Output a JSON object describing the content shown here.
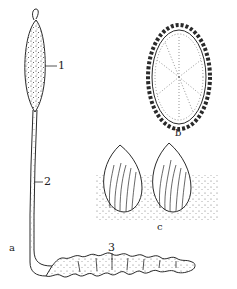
{
  "figure": {
    "panels": [
      {
        "id": "a",
        "label": "a",
        "description": "whole organism: fruiting body rising from host larva"
      },
      {
        "id": "b",
        "label": "b",
        "description": "cross-section of stroma with peripheral perithecia"
      },
      {
        "id": "c",
        "label": "c",
        "description": "enlarged perithecia containing asci"
      }
    ],
    "part_labels": [
      {
        "num": "1"
      },
      {
        "num": "2"
      },
      {
        "num": "3"
      }
    ]
  },
  "colors": {
    "ink": "#2a2a2a",
    "background": "#ffffff"
  }
}
